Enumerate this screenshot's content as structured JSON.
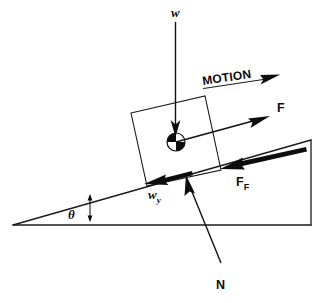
{
  "figure": {
    "kind": "physics-free-body-diagram",
    "background_color": "#ffffff",
    "ink_color": "#0d0d0d",
    "labels": {
      "weight": "w",
      "weight_parallel": "w",
      "weight_parallel_sub": "y",
      "applied_force": "F",
      "friction": "F",
      "friction_sub": "F",
      "normal": "N",
      "angle": "θ",
      "motion": "MOTION"
    },
    "elements": [
      {
        "name": "incline-triangle",
        "type": "shape",
        "description": "right triangle ramp with apex at left"
      },
      {
        "name": "block",
        "type": "shape",
        "description": "square block rotated to rest on incline surface"
      },
      {
        "name": "center-of-mass-marker",
        "type": "symbol",
        "description": "quartered circle at block centroid"
      },
      {
        "name": "weight-vector",
        "type": "vector",
        "direction": "down",
        "label": "w"
      },
      {
        "name": "applied-force-vector",
        "type": "vector",
        "direction": "up-right along incline",
        "label": "F"
      },
      {
        "name": "friction-vector",
        "type": "vector",
        "direction": "down-left along incline",
        "label": "F_F"
      },
      {
        "name": "weight-component-vector",
        "type": "vector",
        "direction": "down-left along incline",
        "label": "w_y"
      },
      {
        "name": "normal-vector",
        "type": "vector",
        "direction": "perpendicular to incline, upward",
        "label": "N"
      },
      {
        "name": "motion-arrow",
        "type": "annotation",
        "direction": "up-right",
        "label": "MOTION"
      },
      {
        "name": "angle-marker",
        "type": "annotation",
        "label": "θ"
      }
    ]
  }
}
